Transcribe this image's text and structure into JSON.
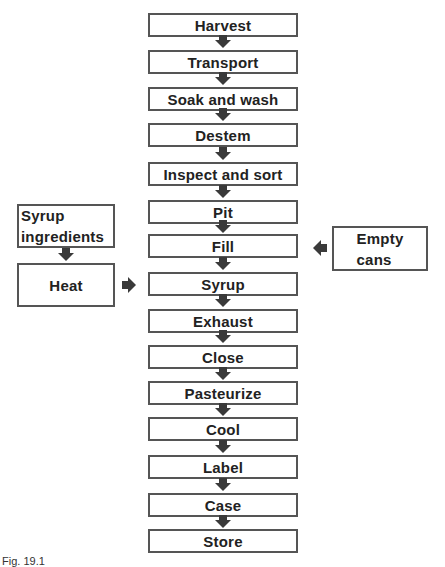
{
  "diagram": {
    "type": "flowchart",
    "steps": [
      {
        "label": "Harvest"
      },
      {
        "label": "Transport"
      },
      {
        "label": "Soak and wash"
      },
      {
        "label": "Destem"
      },
      {
        "label": "Inspect and sort"
      },
      {
        "label": "Pit"
      },
      {
        "label": "Fill"
      },
      {
        "label": "Syrup"
      },
      {
        "label": "Exhaust"
      },
      {
        "label": "Close"
      },
      {
        "label": "Pasteurize"
      },
      {
        "label": "Cool"
      },
      {
        "label": "Label"
      },
      {
        "label": "Case"
      },
      {
        "label": "Store"
      }
    ],
    "side_inputs": {
      "syrup_ingredients": {
        "line1": "Syrup",
        "line2": "ingredients"
      },
      "heat": {
        "label": "Heat",
        "feeds_into": "Syrup"
      },
      "empty_cans": {
        "line1": "Empty",
        "line2": "cans",
        "feeds_into": "Fill"
      }
    },
    "caption": "Fig. 19.1"
  }
}
